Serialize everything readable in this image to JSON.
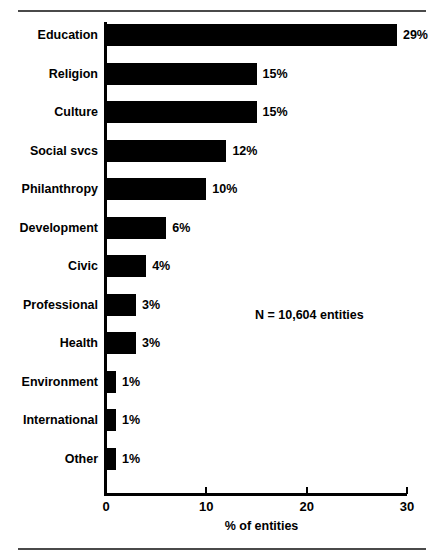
{
  "chart_data": {
    "type": "bar",
    "orientation": "horizontal",
    "title": "",
    "xlabel": "% of entities",
    "ylabel": "",
    "xlim": [
      0,
      30
    ],
    "xticks": [
      0,
      10,
      20,
      30
    ],
    "xtick_labels": [
      "0",
      "10",
      "20",
      "30"
    ],
    "grid": false,
    "legend": null,
    "annotations": [
      "N = 10,604 entities"
    ],
    "categories": [
      "Education",
      "Religion",
      "Culture",
      "Social svcs",
      "Philanthropy",
      "Development",
      "Civic",
      "Professional",
      "Health",
      "Environment",
      "International",
      "Other"
    ],
    "values": [
      29,
      15,
      15,
      12,
      10,
      6,
      4,
      3,
      3,
      1,
      1,
      1
    ],
    "data_labels": [
      "29%",
      "15%",
      "15%",
      "12%",
      "10%",
      "6%",
      "4%",
      "3%",
      "3%",
      "1%",
      "1%",
      "1%"
    ],
    "bar_color": "#000000",
    "background_color": "#ffffff"
  },
  "figure": {
    "annotation_text": "N = 10,604 entities",
    "axis_title": "% of entities"
  }
}
